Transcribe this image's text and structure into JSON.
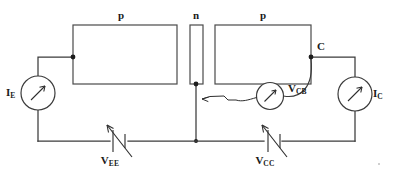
{
  "diagram": {
    "type": "circuit-schematic",
    "width": 393,
    "height": 175,
    "background_color": "#ffffff",
    "line_color": "#3b3b3b",
    "text_color": "#1a1a1a"
  },
  "regions": [
    {
      "id": "emitter-region",
      "label": "p",
      "role": "emitter"
    },
    {
      "id": "base-region",
      "label": "n",
      "role": "base"
    },
    {
      "id": "collector-region",
      "label": "p",
      "role": "collector"
    }
  ],
  "terminals": [
    {
      "id": "collector-terminal",
      "label": "C"
    }
  ],
  "meters": [
    {
      "id": "emitter-current-meter",
      "symbol": "I",
      "subscript": "E",
      "label": "I_E",
      "kind": "ammeter",
      "position": "left"
    },
    {
      "id": "collector-base-voltage-meter",
      "symbol": "V",
      "subscript": "CB",
      "label": "V_CB",
      "kind": "voltmeter",
      "position": "center"
    },
    {
      "id": "collector-current-meter",
      "symbol": "I",
      "subscript": "C",
      "label": "I_C",
      "kind": "ammeter",
      "position": "right"
    }
  ],
  "sources": [
    {
      "id": "emitter-supply",
      "symbol": "V",
      "subscript": "EE",
      "label": "V_EE",
      "kind": "variable-dc-source",
      "position": "bottom-left"
    },
    {
      "id": "collector-supply",
      "symbol": "V",
      "subscript": "CC",
      "label": "V_CC",
      "kind": "variable-dc-source",
      "position": "bottom-right"
    }
  ],
  "annotations": [
    {
      "id": "base-pointer",
      "kind": "leader-arrow",
      "points_to": "base-node",
      "from": "collector-base-voltage-meter"
    }
  ]
}
